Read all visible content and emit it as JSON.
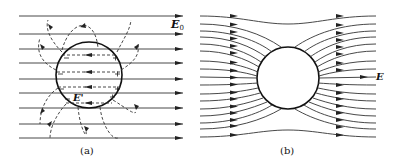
{
  "panels": [
    {
      "id": "a",
      "caption": "(a)",
      "field_label": "E",
      "field_subscript": "0",
      "inner_field_label": "E'",
      "description": "Dielectric sphere in uniform external field E0: induced surface charges (− on left, + on right) create an internal opposing field E' (dashed lines with left-pointing arrows); dashed curved lines show the polarization field outside.",
      "left_charges": [
        "−",
        "−",
        "−",
        "−"
      ],
      "right_charges": [
        "+",
        "+",
        "+",
        "+"
      ]
    },
    {
      "id": "b",
      "caption": "(b)",
      "field_label": "E",
      "description": "Resulting field lines around the sphere: uniform field lines bending around the sphere, converging towards it and spreading out behind it."
    }
  ],
  "colors": {
    "line": "#222222",
    "background": "#ffffff"
  }
}
